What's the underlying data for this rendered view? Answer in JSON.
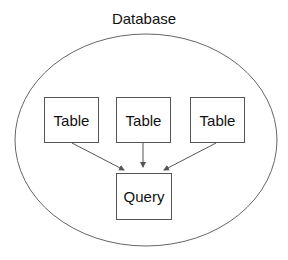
{
  "diagram": {
    "title": "Database",
    "tables": [
      {
        "label": "Table"
      },
      {
        "label": "Table"
      },
      {
        "label": "Table"
      }
    ],
    "query": {
      "label": "Query"
    },
    "edges": [
      {
        "from": "table-1",
        "to": "query"
      },
      {
        "from": "table-2",
        "to": "query"
      },
      {
        "from": "table-3",
        "to": "query"
      }
    ],
    "colors": {
      "stroke": "#555555",
      "text": "#111111",
      "background": "#ffffff"
    }
  }
}
